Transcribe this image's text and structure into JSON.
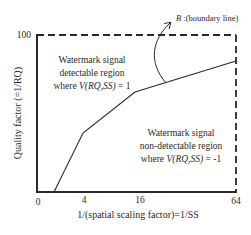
{
  "diagram": {
    "y_axis": {
      "label": "Quality factor (=1/RQ)",
      "ticks": [
        {
          "label": "100",
          "value": 100
        }
      ]
    },
    "x_axis": {
      "label": "1/(spatial scaling factor)=1/SS",
      "ticks": [
        {
          "label": "0",
          "value": 0
        },
        {
          "label": "4",
          "value": 4
        },
        {
          "label": "16",
          "value": 16
        },
        {
          "label": "64",
          "value": 64
        }
      ]
    },
    "regions": {
      "detectable": {
        "line1": "Watermark signal",
        "line2": "detectable region",
        "line3_prefix": "where ",
        "line3_func": "V(RQ,SS)",
        "line3_suffix": " = 1"
      },
      "non_detectable": {
        "line1": "Watermark signal",
        "line2": "non-detectable region",
        "line3_prefix": "where ",
        "line3_func": "V(RQ,SS)",
        "line3_suffix": " = -1"
      }
    },
    "boundary": {
      "symbol": "B",
      "label": " :(boundary line)"
    },
    "colors": {
      "line": "#2a2a2a",
      "background": "#ffffff"
    }
  }
}
